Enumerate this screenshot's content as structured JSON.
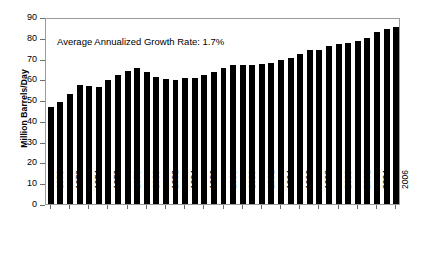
{
  "chart_data": {
    "type": "bar",
    "title": "",
    "xlabel": "",
    "ylabel": "Million Barrels/Day",
    "ylim": [
      0,
      90
    ],
    "ytick_values": [
      0,
      10,
      20,
      30,
      40,
      50,
      60,
      70,
      80,
      90
    ],
    "ytick_labels": [
      "0",
      "10",
      "20",
      "30",
      "40",
      "50",
      "60",
      "70",
      "80",
      "90"
    ],
    "grid": false,
    "legend": null,
    "bar_color": "#000000",
    "frame_color": "#9a9a9a",
    "background_color": "#ffffff",
    "annotations": [
      {
        "text": "Average Annualized Growth Rate: 1.7%",
        "x": 1972,
        "y": 76
      }
    ],
    "xtick_labels": [
      "1970",
      "1972",
      "1974",
      "1976",
      "1978",
      "1980",
      "1982",
      "1984",
      "1986",
      "1988",
      "1990",
      "1992",
      "1994",
      "1996",
      "1998",
      "2000",
      "2002",
      "2004",
      "2006"
    ],
    "categories": [
      "1970",
      "1971",
      "1972",
      "1973",
      "1974",
      "1975",
      "1976",
      "1977",
      "1978",
      "1979",
      "1980",
      "1981",
      "1982",
      "1983",
      "1984",
      "1985",
      "1986",
      "1987",
      "1988",
      "1989",
      "1990",
      "1991",
      "1992",
      "1993",
      "1994",
      "1995",
      "1996",
      "1997",
      "1998",
      "1999",
      "2000",
      "2001",
      "2002",
      "2003",
      "2004",
      "2005",
      "2006"
    ],
    "values": [
      46.8,
      49.3,
      53.0,
      57.2,
      56.8,
      56.3,
      59.8,
      62.0,
      64.2,
      65.5,
      63.4,
      61.2,
      60.0,
      59.5,
      60.5,
      60.8,
      62.3,
      63.6,
      65.7,
      66.7,
      66.8,
      67.1,
      67.6,
      68.1,
      69.5,
      70.4,
      72.1,
      73.9,
      74.2,
      76.0,
      77.0,
      77.6,
      78.3,
      79.8,
      82.6,
      84.1,
      85.0
    ]
  }
}
